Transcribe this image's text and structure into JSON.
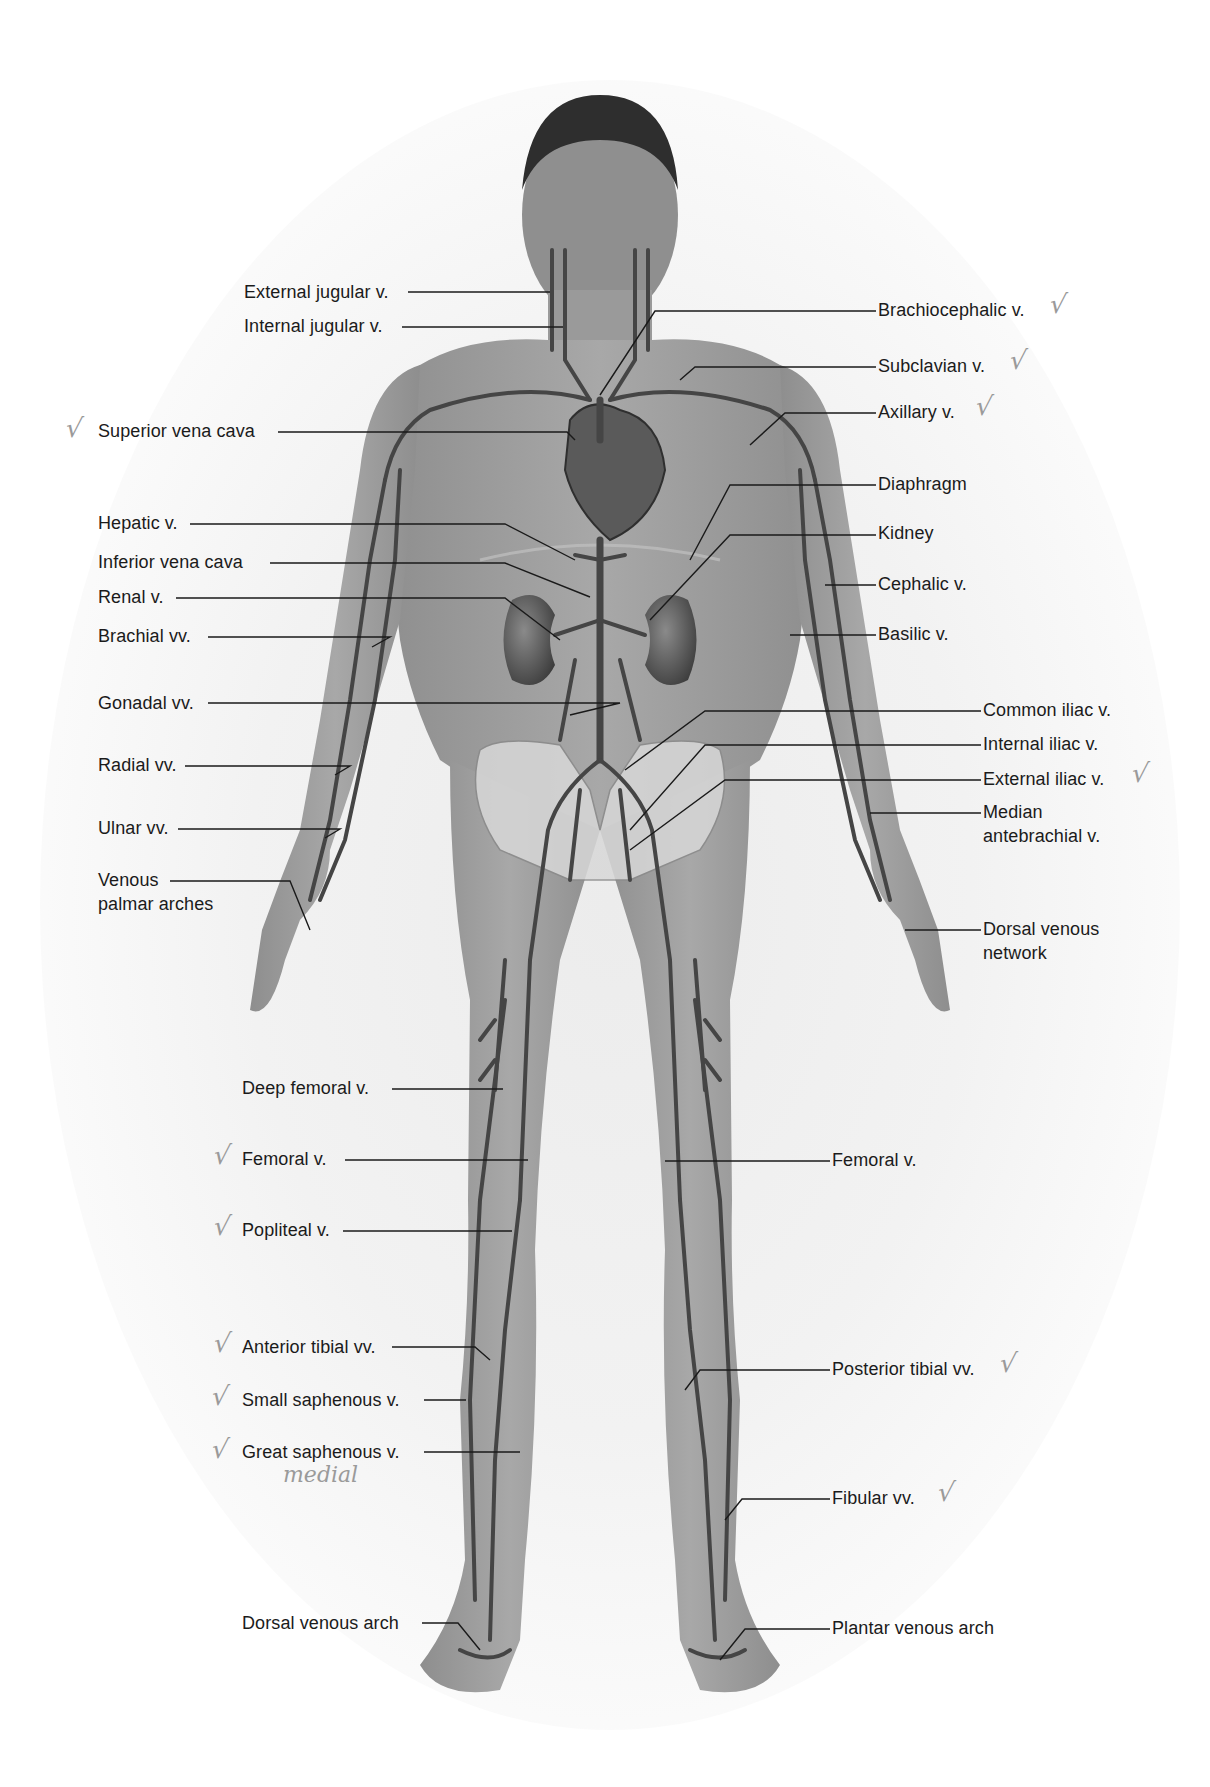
{
  "figure": {
    "colors": {
      "background": "#ffffff",
      "skin": "#9c9c9c",
      "vein": "#4a4a4a",
      "leader_line": "#1a1a1a",
      "text": "#1b1b1b",
      "pencil_marks": "#9a9a9a"
    }
  },
  "labels_left": [
    {
      "id": "external-jugular",
      "text": "External jugular v.",
      "x": 244,
      "y": 281,
      "checked": false
    },
    {
      "id": "internal-jugular",
      "text": "Internal jugular v.",
      "x": 244,
      "y": 315,
      "checked": false
    },
    {
      "id": "superior-vena-cava",
      "text": "Superior vena cava",
      "x": 98,
      "y": 420,
      "checked": true
    },
    {
      "id": "hepatic",
      "text": "Hepatic v.",
      "x": 98,
      "y": 512,
      "checked": false
    },
    {
      "id": "inferior-vena-cava",
      "text": "Inferior vena cava",
      "x": 98,
      "y": 551,
      "checked": false
    },
    {
      "id": "renal",
      "text": "Renal v.",
      "x": 98,
      "y": 586,
      "checked": false
    },
    {
      "id": "brachial",
      "text": "Brachial vv.",
      "x": 98,
      "y": 625,
      "checked": false
    },
    {
      "id": "gonadal",
      "text": "Gonadal vv.",
      "x": 98,
      "y": 692,
      "checked": false
    },
    {
      "id": "radial",
      "text": "Radial vv.",
      "x": 98,
      "y": 754,
      "checked": false
    },
    {
      "id": "ulnar",
      "text": "Ulnar vv.",
      "x": 98,
      "y": 817,
      "checked": false
    },
    {
      "id": "venous-palmar-arches",
      "text": "Venous palmar arches",
      "line1": "Venous",
      "line2": "palmar arches",
      "x": 98,
      "y": 869,
      "checked": false
    },
    {
      "id": "deep-femoral",
      "text": "Deep femoral v.",
      "x": 242,
      "y": 1077,
      "checked": false
    },
    {
      "id": "femoral-left",
      "text": "Femoral v.",
      "x": 242,
      "y": 1148,
      "checked": true
    },
    {
      "id": "popliteal",
      "text": "Popliteal v.",
      "x": 242,
      "y": 1219,
      "checked": true
    },
    {
      "id": "anterior-tibial",
      "text": "Anterior tibial vv.",
      "x": 242,
      "y": 1336,
      "checked": true
    },
    {
      "id": "small-saphenous",
      "text": "Small saphenous v.",
      "x": 242,
      "y": 1389,
      "checked": true
    },
    {
      "id": "great-saphenous",
      "text": "Great saphenous v.",
      "x": 242,
      "y": 1441,
      "checked": true
    },
    {
      "id": "dorsal-venous-arch",
      "text": "Dorsal venous arch",
      "x": 242,
      "y": 1612,
      "checked": false
    }
  ],
  "labels_right": [
    {
      "id": "brachiocephalic",
      "text": "Brachiocephalic v.",
      "x": 878,
      "y": 299,
      "checked": true
    },
    {
      "id": "subclavian",
      "text": "Subclavian v.",
      "x": 878,
      "y": 355,
      "checked": true
    },
    {
      "id": "axillary",
      "text": "Axillary v.",
      "x": 878,
      "y": 401,
      "checked": true
    },
    {
      "id": "diaphragm",
      "text": "Diaphragm",
      "x": 878,
      "y": 473,
      "checked": false
    },
    {
      "id": "kidney",
      "text": "Kidney",
      "x": 878,
      "y": 522,
      "checked": false
    },
    {
      "id": "cephalic",
      "text": "Cephalic v.",
      "x": 878,
      "y": 573,
      "checked": false
    },
    {
      "id": "basilic",
      "text": "Basilic v.",
      "x": 878,
      "y": 623,
      "checked": false
    },
    {
      "id": "common-iliac",
      "text": "Common iliac v.",
      "x": 983,
      "y": 699,
      "checked": false
    },
    {
      "id": "internal-iliac",
      "text": "Internal iliac v.",
      "x": 983,
      "y": 733,
      "checked": false
    },
    {
      "id": "external-iliac",
      "text": "External iliac v.",
      "x": 983,
      "y": 768,
      "checked": true
    },
    {
      "id": "median-antebrachial",
      "text": "Median antebrachial v.",
      "line1": "Median",
      "line2": "antebrachial v.",
      "x": 983,
      "y": 801,
      "checked": false
    },
    {
      "id": "dorsal-venous-network",
      "text": "Dorsal venous network",
      "line1": "Dorsal venous",
      "line2": "network",
      "x": 983,
      "y": 918,
      "checked": false
    },
    {
      "id": "femoral-right",
      "text": "Femoral v.",
      "x": 832,
      "y": 1149,
      "checked": false
    },
    {
      "id": "posterior-tibial",
      "text": "Posterior tibial vv.",
      "x": 832,
      "y": 1358,
      "checked": true
    },
    {
      "id": "fibular",
      "text": "Fibular vv.",
      "x": 832,
      "y": 1487,
      "checked": true
    },
    {
      "id": "plantar-venous-arch",
      "text": "Plantar venous arch",
      "x": 832,
      "y": 1617,
      "checked": false
    }
  ],
  "annotations": {
    "check_glyph": "√",
    "handwritten_note": "medial"
  }
}
